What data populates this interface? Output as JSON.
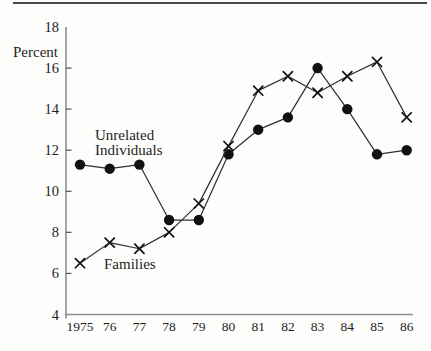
{
  "figure": {
    "background": "#fdfdfb",
    "top_rule_color": "#4a4a4a",
    "axis_color": "#8f8f8f",
    "tick_color": "#5a5a5a",
    "text_color": "#1f1f1f",
    "line_color": "#2e2e2e",
    "marker_color": "#111111"
  },
  "chart_data": {
    "type": "line",
    "title": "",
    "ylabel": "Percent",
    "xlabel": "",
    "ylim": [
      4,
      18
    ],
    "yticks": [
      18,
      16,
      14,
      12,
      10,
      8,
      6,
      4
    ],
    "grid": false,
    "legend": "inline-labels",
    "categories": [
      "1975",
      "76",
      "77",
      "78",
      "79",
      "80",
      "81",
      "82",
      "83",
      "84",
      "85",
      "86"
    ],
    "series": [
      {
        "name": "Unrelated Individuals",
        "label_lines": [
          "Unrelated",
          "Individuals"
        ],
        "marker": "circle",
        "values": [
          11.3,
          11.1,
          11.3,
          8.6,
          8.6,
          11.8,
          13.0,
          13.6,
          16.0,
          14.0,
          11.8,
          12.0
        ]
      },
      {
        "name": "Families",
        "label_lines": [
          "Families"
        ],
        "marker": "x",
        "values": [
          6.5,
          7.5,
          7.2,
          8.0,
          9.4,
          12.2,
          14.9,
          15.6,
          14.8,
          15.6,
          16.3,
          13.6
        ]
      }
    ]
  }
}
